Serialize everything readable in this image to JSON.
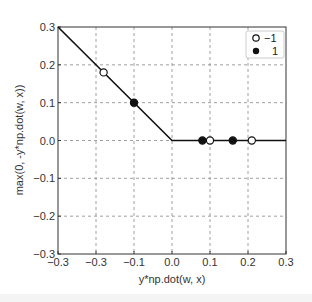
{
  "chart_data": {
    "type": "line",
    "title": "",
    "xlabel": "y*np.dot(w, x)",
    "ylabel": "max(0, -y*np.dot(w, x))",
    "xlim": [
      -0.3,
      0.3
    ],
    "ylim": [
      -0.3,
      0.3
    ],
    "grid": true,
    "grid_style": "dashed",
    "x_tick_labels": [
      "−0.3",
      "−0.3",
      "−0.1",
      "0.0",
      "0.1",
      "0.2",
      "0.3"
    ],
    "x_tick_values": [
      -0.3,
      -0.2,
      -0.1,
      0.0,
      0.1,
      0.2,
      0.3
    ],
    "y_tick_labels": [
      "−0.3",
      "−0.2",
      "−0.1",
      "0.0",
      "0.1",
      "0.2",
      "0.3"
    ],
    "y_tick_values": [
      -0.3,
      -0.2,
      -0.1,
      0.0,
      0.1,
      0.2,
      0.3
    ],
    "line": {
      "name": "max(0, -x)",
      "x": [
        -0.3,
        0.0,
        0.3
      ],
      "y": [
        0.3,
        0.0,
        0.0
      ],
      "color": "#111111"
    },
    "series": [
      {
        "name": "−1",
        "marker": "open-circle",
        "x": [
          -0.18,
          0.1,
          0.21
        ],
        "y": [
          0.18,
          0.0,
          0.0
        ]
      },
      {
        "name": "1",
        "marker": "filled-circle",
        "x": [
          -0.1,
          0.08,
          0.16
        ],
        "y": [
          0.1,
          0.0,
          0.0
        ]
      }
    ],
    "legend": {
      "position": "upper right",
      "entries": [
        "−1",
        "1"
      ]
    }
  }
}
